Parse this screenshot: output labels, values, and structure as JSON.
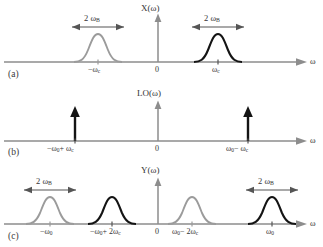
{
  "figure": {
    "type": "signal-spectrum-diagram",
    "colors": {
      "gray_trace": "#9b9b9b",
      "black_trace": "#141414",
      "axis": "#8d8d8d",
      "text": "#333333"
    },
    "panels": [
      {
        "tag": "(a)",
        "axis_title": "X(ω)",
        "axis_label": "ω",
        "origin_label": "0",
        "measures": [
          {
            "label": "2 ω",
            "sub": "B",
            "side": "left"
          },
          {
            "label": "2 ω",
            "sub": "B",
            "side": "right"
          }
        ],
        "ticks": [
          {
            "label": "−ω",
            "sub": "c",
            "color": "gray"
          },
          {
            "label": "ω",
            "sub": "c",
            "color": "black"
          }
        ],
        "pulses": [
          {
            "center_label": "−ωc",
            "color": "gray"
          },
          {
            "center_label": "ωc",
            "color": "black"
          }
        ]
      },
      {
        "tag": "(b)",
        "axis_title": "LO(ω)",
        "axis_label": "ω",
        "origin_label": "0",
        "measures": [],
        "impulses": [
          {
            "label_pre": "−ω",
            "label_sub1": "0",
            "label_op": "+ ω",
            "label_sub2": "c",
            "color": "black"
          },
          {
            "label_pre": "ω",
            "label_sub1": "0",
            "label_op": "− ω",
            "label_sub2": "c",
            "color": "black"
          }
        ]
      },
      {
        "tag": "(c)",
        "axis_title": "Y(ω)",
        "axis_label": "ω",
        "origin_label": "0",
        "measures": [
          {
            "label": "2 ω",
            "sub": "B",
            "side": "left"
          },
          {
            "label": "2 ω",
            "sub": "B",
            "side": "right"
          }
        ],
        "pulses": [
          {
            "center_label": "−ω0",
            "color": "gray"
          },
          {
            "center_label": "−ω0 + 2ωc",
            "color": "black"
          },
          {
            "center_label": "ω0 − 2ωc",
            "color": "gray"
          },
          {
            "center_label": "ω0",
            "color": "black"
          }
        ]
      }
    ],
    "text": {
      "panel_a_tag": "(a)",
      "panel_b_tag": "(b)",
      "panel_c_tag": "(c)",
      "title_a": "X(ω)",
      "title_b": "LO(ω)",
      "title_c": "Y(ω)",
      "omega_axis": "ω",
      "zero": "0",
      "two_omega_b": "2 ω",
      "sub_B": "B",
      "sub_c": "c",
      "sub_0": "0",
      "neg_omega_c": "−ω",
      "pos_omega_c": "ω",
      "b_left_1": "−ω",
      "b_left_2": "+ ω",
      "b_right_1": "ω",
      "b_right_2": "− ω",
      "c_lbl1_a": "−ω",
      "c_lbl2_a": "−ω",
      "c_lbl2_b": "+ 2ω",
      "c_lbl3_a": "ω",
      "c_lbl3_b": "− 2ω",
      "c_lbl4_a": "ω"
    }
  }
}
